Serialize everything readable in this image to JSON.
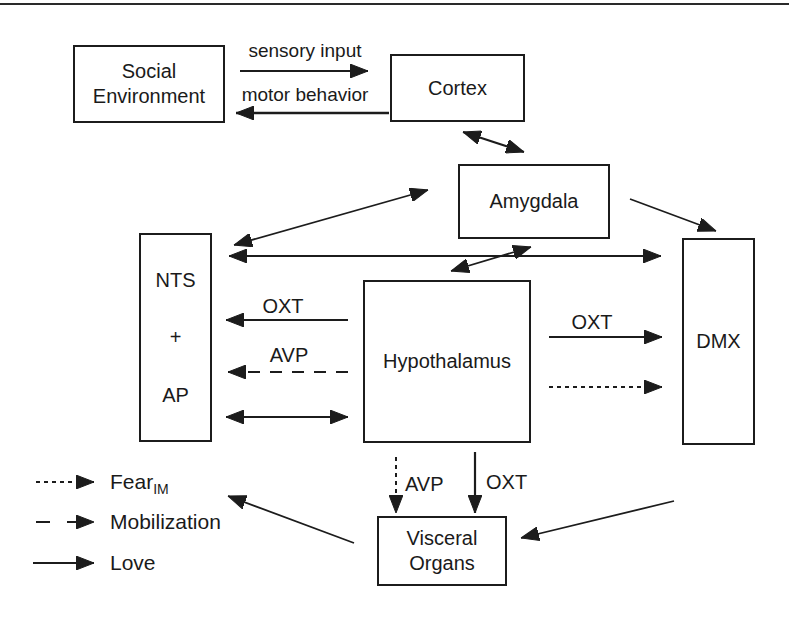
{
  "figure": {
    "colors": {
      "ink": "#1c1c1c",
      "background": "#ffffff"
    },
    "boxes": {
      "social_environment": {
        "line1": "Social",
        "line2": "Environment"
      },
      "cortex": {
        "label": "Cortex"
      },
      "amygdala": {
        "label": "Amygdala"
      },
      "nts_ap": {
        "line1": "NTS",
        "line2": "+",
        "line3": "AP"
      },
      "hypothalamus": {
        "label": "Hypothalamus"
      },
      "dmx": {
        "label": "DMX"
      },
      "visceral_organs": {
        "line1": "Visceral",
        "line2": "Organs"
      }
    },
    "edges": [
      {
        "name": "social-environment-to-cortex",
        "label": "sensory input",
        "style": "solid",
        "bidirectional": false
      },
      {
        "name": "cortex-to-social-environment",
        "label": "motor behavior",
        "style": "solid",
        "bidirectional": false
      },
      {
        "name": "cortex-amygdala",
        "label": "",
        "style": "solid",
        "bidirectional": true
      },
      {
        "name": "amygdala-nts",
        "label": "",
        "style": "solid",
        "bidirectional": true
      },
      {
        "name": "nts-dmx",
        "label": "",
        "style": "solid",
        "bidirectional": true
      },
      {
        "name": "amygdala-hypothalamus",
        "label": "",
        "style": "solid",
        "bidirectional": true
      },
      {
        "name": "amygdala-to-dmx",
        "label": "",
        "style": "solid",
        "bidirectional": false
      },
      {
        "name": "hypothalamus-to-nts-oxt",
        "label": "OXT",
        "style": "solid",
        "bidirectional": false
      },
      {
        "name": "hypothalamus-to-nts-avp",
        "label": "AVP",
        "style": "dashed",
        "bidirectional": false
      },
      {
        "name": "nts-hypothalamus",
        "label": "",
        "style": "solid",
        "bidirectional": true
      },
      {
        "name": "hypothalamus-to-dmx-oxt",
        "label": "OXT",
        "style": "solid",
        "bidirectional": false
      },
      {
        "name": "hypothalamus-to-dmx-fear",
        "label": "",
        "style": "dotted",
        "bidirectional": false
      },
      {
        "name": "hypothalamus-to-visceral-avp",
        "label": "AVP",
        "style": "dotted",
        "bidirectional": false
      },
      {
        "name": "hypothalamus-to-visceral-oxt",
        "label": "OXT",
        "style": "solid",
        "bidirectional": false
      },
      {
        "name": "right-to-visceral",
        "label": "",
        "style": "solid",
        "bidirectional": false
      },
      {
        "name": "visceral-to-nts",
        "label": "",
        "style": "solid",
        "bidirectional": false
      }
    ],
    "legend": {
      "items": [
        {
          "style": "dotted",
          "label": "Fear",
          "subscript": "IM"
        },
        {
          "style": "dashed",
          "label": "Mobilization",
          "subscript": ""
        },
        {
          "style": "solid",
          "label": "Love",
          "subscript": ""
        }
      ]
    }
  }
}
